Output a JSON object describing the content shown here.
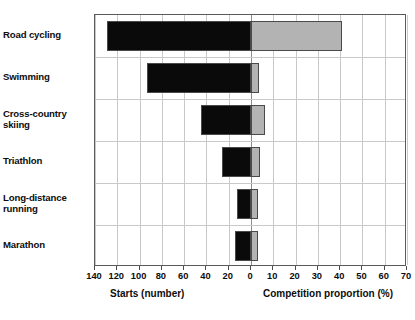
{
  "chart_data": {
    "type": "bar",
    "orientation": "horizontal",
    "layout": "bidirectional-paired",
    "title": "",
    "subtitle": "",
    "categories": [
      "Road cycling",
      "Swimming",
      "Cross-country skiing",
      "Triathlon",
      "Long-distance running",
      "Marathon"
    ],
    "category_labels_wrapped": [
      [
        "Road cycling"
      ],
      [
        "Swimming"
      ],
      [
        "Cross-country",
        "skiing"
      ],
      [
        "Triathlon"
      ],
      [
        "Long-distance",
        "running"
      ],
      [
        "Marathon"
      ]
    ],
    "series": [
      {
        "name": "Starts (number)",
        "axis": "left",
        "direction": "left",
        "color": "#0a0a0a",
        "values": [
          129,
          93,
          45,
          26,
          13,
          14
        ],
        "unit": "number"
      },
      {
        "name": "Competition proportion (%)",
        "axis": "right",
        "direction": "right",
        "color": "#b3b3b3",
        "values": [
          41,
          3.5,
          6.5,
          4,
          3,
          3
        ],
        "unit": "%"
      }
    ],
    "left_axis": {
      "label": "Starts (number)",
      "ticks": [
        140,
        120,
        100,
        80,
        60,
        40,
        20,
        0
      ],
      "tick_labels": [
        "140",
        "120",
        "100",
        "80",
        "60",
        "40",
        "20",
        "0"
      ],
      "min": 0,
      "max": 140,
      "reversed": true
    },
    "right_axis": {
      "label": "Competition proportion (%)",
      "ticks": [
        0,
        10,
        20,
        30,
        40,
        50,
        60,
        70
      ],
      "tick_labels": [
        "0",
        "10",
        "20",
        "30",
        "40",
        "50",
        "60",
        "70"
      ],
      "min": 0,
      "max": 70,
      "reversed": false
    },
    "all_tick_labels": [
      "140",
      "120",
      "100",
      "80",
      "60",
      "40",
      "20",
      "0",
      "10",
      "20",
      "30",
      "40",
      "50",
      "60",
      "70"
    ],
    "grid": true,
    "grid_color": "#c9c9c9",
    "zero_line_color": "#8a8a8a",
    "frame_color": "#5a5a5a",
    "legend": "none",
    "ylabel": "",
    "xlabel": ""
  },
  "axis_titles": {
    "left": "Starts (number)",
    "right": "Competition proportion (%)"
  },
  "caption_fragment": ""
}
